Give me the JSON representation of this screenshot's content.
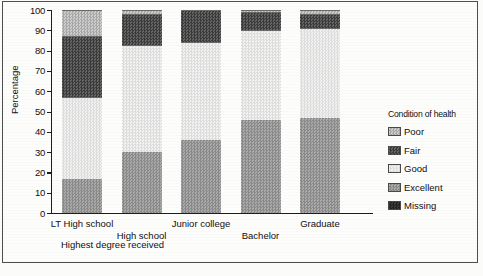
{
  "chart_data": {
    "type": "bar",
    "subtype": "stacked-bar-100",
    "title": "",
    "xlabel": "Highest degree received",
    "ylabel": "Percentage",
    "ylim": [
      0,
      100
    ],
    "yticks": [
      0,
      10,
      20,
      30,
      40,
      50,
      60,
      70,
      80,
      90,
      100
    ],
    "grid": false,
    "legend_position": "right",
    "legend_title": "Condition of health",
    "categories": [
      "LT High school",
      "High school",
      "Junior college",
      "Bachelor",
      "Graduate"
    ],
    "stack_order_bottom_to_top": [
      "Excellent",
      "Good",
      "Fair",
      "Poor"
    ],
    "series": [
      {
        "name": "Poor",
        "values": [
          13,
          2,
          0,
          1,
          2
        ]
      },
      {
        "name": "Fair",
        "values": [
          30,
          15,
          16,
          9,
          7
        ]
      },
      {
        "name": "Good",
        "values": [
          40,
          53,
          48,
          44,
          44
        ]
      },
      {
        "name": "Excellent",
        "values": [
          17,
          30,
          36,
          46,
          47
        ]
      },
      {
        "name": "Missing",
        "values": [
          0,
          0,
          0,
          0,
          0
        ]
      }
    ],
    "cumulative_tops": {
      "LT High school": {
        "Excellent": 17,
        "Good": 57,
        "Fair": 87,
        "Poor": 100
      },
      "High school": {
        "Excellent": 30,
        "Good": 83,
        "Fair": 98,
        "Poor": 100
      },
      "Junior college": {
        "Excellent": 36,
        "Good": 84,
        "Fair": 100,
        "Poor": 100
      },
      "Bachelor": {
        "Excellent": 46,
        "Good": 90,
        "Fair": 99,
        "Poor": 100
      },
      "Graduate": {
        "Excellent": 47,
        "Good": 91,
        "Fair": 98,
        "Poor": 100
      }
    }
  },
  "axis": {
    "y_title": "Percentage",
    "x_title": "Highest degree received",
    "y_tick_labels": [
      "100",
      "90",
      "80",
      "70",
      "60",
      "50",
      "40",
      "30",
      "20",
      "10",
      "0"
    ]
  },
  "categories": [
    {
      "label": "LT High school",
      "row": 0
    },
    {
      "label": "High school",
      "row": 1
    },
    {
      "label": "Junior college",
      "row": 0
    },
    {
      "label": "Bachelor",
      "row": 1
    },
    {
      "label": "Graduate",
      "row": 0
    }
  ],
  "legend": {
    "title": "Condition of health",
    "items": [
      {
        "label": "Poor",
        "pattern": "p-poor",
        "color": "#b9b9b9"
      },
      {
        "label": "Fair",
        "pattern": "p-fair",
        "color": "#4f4f4f"
      },
      {
        "label": "Good",
        "pattern": "p-good",
        "color": "#e8e8e6"
      },
      {
        "label": "Excellent",
        "pattern": "p-excellent",
        "color": "#9a9a9a"
      },
      {
        "label": "Missing",
        "pattern": "p-missing",
        "color": "#2e2e2e"
      }
    ]
  },
  "colors": {
    "axis": "#1d1d1d",
    "text": "#101010",
    "frame": "#4d4d4d",
    "background": "#fdfdfc"
  }
}
